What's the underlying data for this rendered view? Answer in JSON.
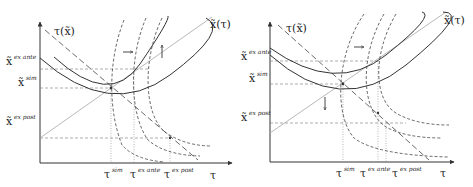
{
  "figure": {
    "panels": [
      {
        "id": "left",
        "axes": {
          "x_label": "τ",
          "y_label": ""
        },
        "curve_labels": {
          "tau_of_x": "τ(x̃)",
          "x_of_tau": "x̃(τ)"
        },
        "y_ticks": [
          {
            "base": "x̃",
            "sup": "ex ante"
          },
          {
            "base": "x̃",
            "sup": "sim"
          },
          {
            "base": "x̃",
            "sup": "ex post"
          }
        ],
        "x_ticks": [
          {
            "base": "τ",
            "sup": "sim"
          },
          {
            "base": "τ",
            "sup": "ex ante"
          },
          {
            "base": "τ",
            "sup": "ex post"
          }
        ],
        "arrows": [
          "right",
          "up"
        ]
      },
      {
        "id": "right",
        "axes": {
          "x_label": "τ",
          "y_label": ""
        },
        "curve_labels": {
          "tau_of_x": "τ(x̃)",
          "x_of_tau": "x̃(τ)"
        },
        "y_ticks": [
          {
            "base": "x̃",
            "sup": "ex ante"
          },
          {
            "base": "x̃",
            "sup": "sim"
          },
          {
            "base": "x̃",
            "sup": "ex post"
          }
        ],
        "x_ticks": [
          {
            "base": "τ",
            "sup": "sim"
          },
          {
            "base": "τ",
            "sup": "ex ante"
          },
          {
            "base": "τ",
            "sup": "ex post"
          }
        ],
        "arrows": [
          "right",
          "down"
        ]
      }
    ],
    "colors": {
      "ink": "#333333",
      "grid": "#888888",
      "diagonal": "#b0b0b0"
    }
  }
}
